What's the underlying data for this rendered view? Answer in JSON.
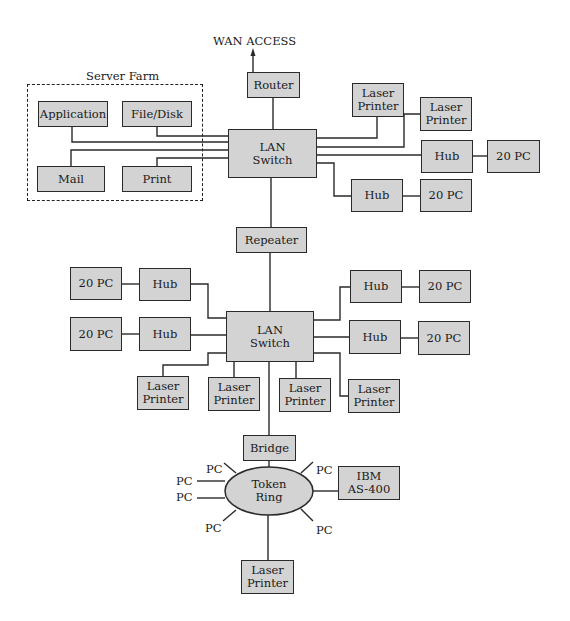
{
  "diagram": {
    "type": "network-topology",
    "top_label": "WAN ACCESS",
    "server_farm": {
      "label": "Server Farm",
      "servers": [
        "Application",
        "File/Disk",
        "Mail",
        "Print"
      ]
    },
    "router": "Router",
    "lan_switch_1": {
      "label": "LAN\nSwitch",
      "printers": [
        "Laser\nPrinter",
        "Laser\nPrinter"
      ],
      "hubs": [
        {
          "hub": "Hub",
          "pcs": "20 PC"
        },
        {
          "hub": "Hub",
          "pcs": "20 PC"
        }
      ]
    },
    "repeater": "Repeater",
    "lan_switch_2": {
      "label": "LAN\nSwitch",
      "left_hubs": [
        {
          "hub": "Hub",
          "pcs": "20 PC"
        },
        {
          "hub": "Hub",
          "pcs": "20 PC"
        }
      ],
      "right_hubs": [
        {
          "hub": "Hub",
          "pcs": "20 PC"
        },
        {
          "hub": "Hub",
          "pcs": "20 PC"
        }
      ],
      "printers": [
        "Laser\nPrinter",
        "Laser\nPrinter",
        "Laser\nPrinter",
        "Laser\nPrinter"
      ]
    },
    "bridge": "Bridge",
    "token_ring": {
      "label": "Token\nRing",
      "pcs": [
        "PC",
        "PC",
        "PC",
        "PC",
        "PC",
        "PC"
      ],
      "mainframe": "IBM\nAS-400",
      "printer": "Laser\nPrinter"
    }
  }
}
